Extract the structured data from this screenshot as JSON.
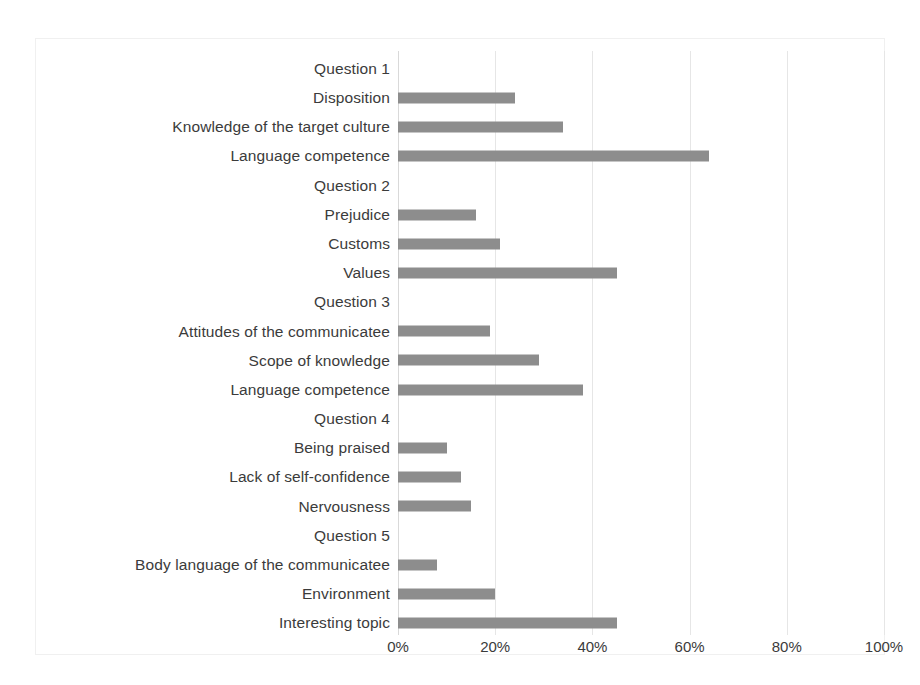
{
  "chart_data": {
    "type": "bar",
    "orientation": "horizontal",
    "title": "",
    "xlabel": "",
    "ylabel": "",
    "xlim": [
      0,
      100
    ],
    "grid": true,
    "legend": "none",
    "bar_color": "#8d8d8d",
    "xticks": [
      "0%",
      "20%",
      "40%",
      "60%",
      "80%",
      "100%"
    ],
    "xtick_values": [
      0,
      20,
      40,
      60,
      80,
      100
    ],
    "categories": [
      "Question 1",
      "Disposition",
      "Knowledge of the target culture",
      "Language competence",
      "Question 2",
      "Prejudice",
      "Customs",
      "Values",
      "Question 3",
      "Attitudes of the communicatee",
      "Scope of knowledge",
      "Language competence",
      "Question 4",
      "Being praised",
      "Lack of self-confidence",
      "Nervousness",
      "Question 5",
      "Body language of the communicatee",
      "Environment",
      "Interesting topic"
    ],
    "values": [
      0,
      24,
      34,
      64,
      0,
      16,
      21,
      45,
      0,
      19,
      29,
      38,
      0,
      10,
      13,
      15,
      0,
      8,
      20,
      45
    ],
    "group_headers": [
      "Question 1",
      "Question 2",
      "Question 3",
      "Question 4",
      "Question 5"
    ]
  }
}
